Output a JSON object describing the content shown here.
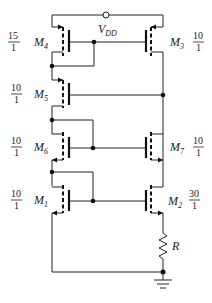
{
  "supply": {
    "name": "V",
    "sub": "DD"
  },
  "transistors": [
    {
      "id": "M4",
      "name": "M",
      "sub": "4",
      "ratio_num": "15",
      "ratio_den": "1"
    },
    {
      "id": "M3",
      "name": "M",
      "sub": "3",
      "ratio_num": "10",
      "ratio_den": "1"
    },
    {
      "id": "M5",
      "name": "M",
      "sub": "5",
      "ratio_num": "10",
      "ratio_den": "1"
    },
    {
      "id": "M6",
      "name": "M",
      "sub": "6",
      "ratio_num": "10",
      "ratio_den": "1"
    },
    {
      "id": "M7",
      "name": "M",
      "sub": "7",
      "ratio_num": "10",
      "ratio_den": "1"
    },
    {
      "id": "M1",
      "name": "M",
      "sub": "1",
      "ratio_num": "10",
      "ratio_den": "1"
    },
    {
      "id": "M2",
      "name": "M",
      "sub": "2",
      "ratio_num": "30",
      "ratio_den": "1"
    }
  ],
  "resistor": {
    "name": "R"
  }
}
